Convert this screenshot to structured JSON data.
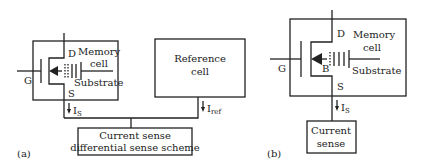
{
  "figure_a": {
    "panel_label": "(a)",
    "memory_cell": {
      "title_line1": "Memory",
      "title_line2": "cell",
      "drain": "D",
      "source": "S",
      "gate": "G",
      "substrate": "Substrate"
    },
    "reference_cell": {
      "line1": "Reference",
      "line2": "cell"
    },
    "current_cell": "I",
    "current_cell_sub": "S",
    "current_ref": "I",
    "current_ref_sub": "ref",
    "sense_block": {
      "line1": "Current sense",
      "line2": "differential sense scheme"
    }
  },
  "figure_b": {
    "panel_label": "(b)",
    "memory_cell": {
      "title_line1": "Memory",
      "title_line2": "cell",
      "drain": "D",
      "source": "S",
      "gate": "G",
      "body": "B",
      "substrate": "Substrate"
    },
    "current_cell": "I",
    "current_cell_sub": "S",
    "sense_block": {
      "line1": "Current",
      "line2": "sense"
    }
  },
  "colors": {
    "line": "#222222",
    "background": "#ffffff"
  }
}
